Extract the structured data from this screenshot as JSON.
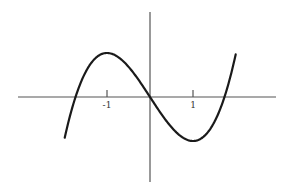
{
  "chart_data": {
    "type": "line",
    "title": "",
    "xlabel": "",
    "ylabel": "",
    "function": "y = (x^3 - 3x) / 2",
    "xlim": [
      -3.05,
      2.93
    ],
    "ylim": [
      -1.93,
      1.95
    ],
    "grid": false,
    "legend": null,
    "x_ticks": [
      {
        "value": -1,
        "label": "-1"
      },
      {
        "value": 1,
        "label": "1"
      }
    ],
    "key_points": [
      {
        "name": "root-left",
        "x": -1.732,
        "y": 0
      },
      {
        "name": "local-max",
        "x": -1,
        "y": 1
      },
      {
        "name": "origin-root",
        "x": 0,
        "y": 0
      },
      {
        "name": "local-min",
        "x": 1,
        "y": -1
      },
      {
        "name": "root-right",
        "x": 1.732,
        "y": 0
      }
    ],
    "series": [
      {
        "name": "f(x)",
        "x_range": [
          -2.53,
          2.44
        ],
        "x": [
          -2.53,
          -2.25,
          -2.0,
          -1.732,
          -1.5,
          -1.25,
          -1.0,
          -0.75,
          -0.5,
          -0.25,
          0.0,
          0.25,
          0.5,
          0.75,
          1.0,
          1.25,
          1.5,
          1.732,
          2.0,
          2.25,
          2.44
        ],
        "y": [
          -4.3,
          -2.32,
          -1.0,
          0.0,
          0.56,
          0.9,
          1.0,
          0.91,
          0.69,
          0.37,
          0.0,
          -0.37,
          -0.69,
          -0.91,
          -1.0,
          -0.9,
          -0.56,
          0.0,
          1.0,
          2.32,
          3.6
        ]
      }
    ],
    "colors": {
      "curve": "#1a1a1a",
      "axes": "#555555",
      "background": "#ffffff"
    }
  },
  "layout": {
    "origin_px": [
      150,
      97
    ],
    "unit_x_px": 43,
    "unit_y_px": 44,
    "x_axis_px": [
      18,
      276
    ],
    "y_axis_px": [
      12,
      182
    ],
    "curve_visible_y_px": [
      50,
      141
    ]
  }
}
